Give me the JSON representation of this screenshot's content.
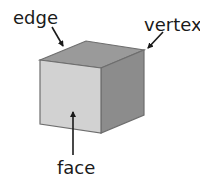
{
  "diagram": {
    "labels": {
      "edge": "edge",
      "vertex": "vertex",
      "face": "face"
    },
    "colors": {
      "front_face": "#d2d2d2",
      "top_face": "#9a9a9a",
      "side_face": "#8c8c8c",
      "outline": "#6e6e6e",
      "arrow": "#1a1a1a"
    }
  }
}
